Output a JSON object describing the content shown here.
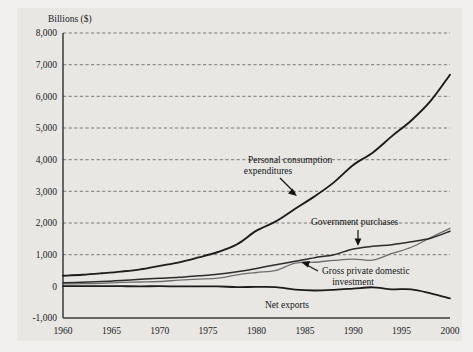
{
  "figure": {
    "background_color": "#f1f0ee",
    "plot_background_color": "#e8e7e4"
  },
  "chart_data": {
    "type": "line",
    "title": "",
    "subtitle": "",
    "xlabel": "",
    "ylabel": "Billions ($)",
    "xlim": [
      1960,
      2000
    ],
    "ylim": [
      -1000,
      8000
    ],
    "xticks": [
      1960,
      1965,
      1970,
      1975,
      1980,
      1985,
      1990,
      1995,
      2000
    ],
    "xtick_labels": [
      "1960",
      "1965",
      "1970",
      "1975",
      "1980",
      "1985",
      "1990",
      "1995",
      "2000"
    ],
    "yticks": [
      -1000,
      0,
      1000,
      2000,
      3000,
      4000,
      5000,
      6000,
      7000,
      8000
    ],
    "ytick_labels": [
      "-1,000",
      "0",
      "1,000",
      "2,000",
      "3,000",
      "4,000",
      "5,000",
      "6,000",
      "7,000",
      "8,000"
    ],
    "grid": true,
    "grid_style": "dashed-horizontal",
    "legend": "none-inline-annotations",
    "x": [
      1960,
      1962,
      1964,
      1966,
      1968,
      1970,
      1972,
      1974,
      1976,
      1978,
      1980,
      1982,
      1984,
      1986,
      1988,
      1990,
      1992,
      1994,
      1996,
      1998,
      2000
    ],
    "series": [
      {
        "name": "Personal consumption expenditures",
        "color": "#1c1c1c",
        "values": [
          332,
          364,
          412,
          466,
          536,
          648,
          757,
          912,
          1084,
          1329,
          1757,
          2051,
          2451,
          2841,
          3283,
          3832,
          4221,
          4743,
          5238,
          5856,
          6683
        ]
      },
      {
        "name": "Government purchases",
        "color": "#2b2b2b",
        "values": [
          113,
          130,
          149,
          182,
          223,
          254,
          284,
          333,
          385,
          459,
          566,
          684,
          791,
          906,
          998,
          1181,
          1265,
          1316,
          1406,
          1518,
          1741
        ]
      },
      {
        "name": "Gross private domestic investment",
        "color": "#6e6e6e",
        "values": [
          78,
          83,
          95,
          126,
          137,
          152,
          195,
          229,
          258,
          363,
          437,
          503,
          736,
          760,
          820,
          861,
          829,
          1038,
          1234,
          1539,
          1833
        ]
      },
      {
        "name": "Net exports",
        "color": "#1c1c1c",
        "values": [
          4,
          5,
          7,
          4,
          1,
          5,
          -4,
          0,
          -3,
          -24,
          -19,
          -25,
          -104,
          -131,
          -111,
          -72,
          -30,
          -93,
          -95,
          -221,
          -380
        ]
      }
    ],
    "annotations": [
      {
        "name": "personal-consumption-expenditures",
        "text_line1": "Personal consumption",
        "text_line2": "expenditures",
        "arrow": "down-right"
      },
      {
        "name": "government-purchases",
        "text_line1": "Government purchases",
        "text_line2": "",
        "arrow": "down"
      },
      {
        "name": "gross-private-domestic-investment",
        "text_line1": "Gross private domestic",
        "text_line2": "investment",
        "arrow": "up-left"
      },
      {
        "name": "net-exports",
        "text_line1": "Net exports",
        "text_line2": "",
        "arrow": "none"
      }
    ]
  }
}
